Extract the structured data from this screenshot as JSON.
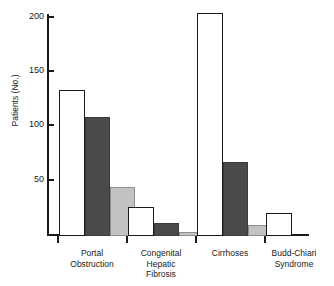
{
  "chart_data": {
    "type": "bar",
    "title": "",
    "xlabel": "",
    "ylabel": "Patients (No.)",
    "ylim": [
      0,
      200
    ],
    "yticks": [
      0,
      50,
      100,
      150,
      200
    ],
    "ytick_labels": [
      "",
      "50",
      "100",
      "150",
      "200"
    ],
    "grid": false,
    "legend": "none",
    "categories": [
      "Portal Obstruction",
      "Congenital Hepatic Fibrosis",
      "Cirrhoses",
      "Budd-Chiari Syndrome"
    ],
    "category_lines": [
      [
        "Portal",
        "Obstruction"
      ],
      [
        "Congenital",
        "Hepatic",
        "Fibrosis"
      ],
      [
        "Cirrhoses"
      ],
      [
        "Budd-Chiari",
        "Syndrome"
      ]
    ],
    "series": [
      {
        "name": "series-white",
        "color": "#ffffff",
        "edge": "#1a1a1a",
        "values": [
          133,
          26,
          203,
          21
        ]
      },
      {
        "name": "series-dark",
        "color": "#4a4a4a",
        "edge": "#3a3a3a",
        "values": [
          108,
          12,
          67,
          0
        ]
      },
      {
        "name": "series-light",
        "color": "#c2c2c2",
        "edge": "#8f8f8f",
        "values": [
          45,
          4,
          10,
          0
        ]
      }
    ]
  },
  "axis": {
    "y_title": "Patients (No.)",
    "tick_200": "200",
    "tick_150": "150",
    "tick_100": "100",
    "tick_50": "50"
  },
  "groups": {
    "g0_l0": "Portal",
    "g0_l1": "Obstruction",
    "g1_l0": "Congenital",
    "g1_l1": "Hepatic",
    "g1_l2": "Fibrosis",
    "g2_l0": "Cirrhoses",
    "g3_l0": "Budd-Chiari",
    "g3_l1": "Syndrome"
  }
}
